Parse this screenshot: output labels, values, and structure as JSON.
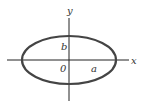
{
  "diagram": {
    "labels": {
      "x_axis": "x",
      "y_axis": "y",
      "origin": "0",
      "semi_major": "a",
      "semi_minor": "b"
    },
    "colors": {
      "axis": "#222222",
      "ellipse": "#444444",
      "text": "#333333",
      "background": "#ffffff"
    }
  }
}
